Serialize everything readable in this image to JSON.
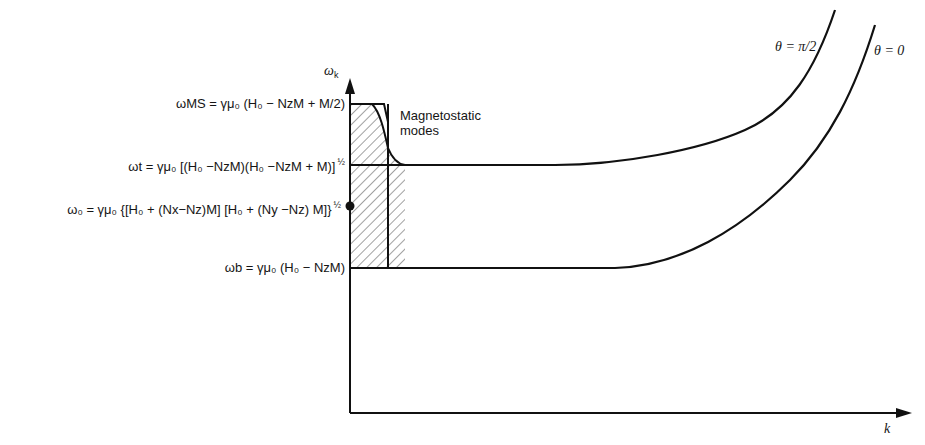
{
  "diagram": {
    "type": "dispersion-diagram",
    "axes": {
      "y_label": "ωk",
      "x_label": "k"
    },
    "levels": {
      "omega_ms": {
        "symbol": "ωMS",
        "expr": "= γμ₀ (H₀ − NzM + M/2)"
      },
      "omega_t": {
        "symbol": "ωt",
        "expr": "= γμ₀ [(H₀ −NzM)(H₀ −NzM + M)]",
        "exponent": "½"
      },
      "omega_0": {
        "symbol": "ω₀",
        "expr": "= γμ₀ {[H₀ + (Nx−Nz)M] [H₀ + (Ny −Nz) M]}",
        "exponent": "½"
      },
      "omega_b": {
        "symbol": "ωb",
        "expr": "= γμ₀ (H₀ − NzM)"
      }
    },
    "annotations": {
      "magnetostatic": [
        "Magnetostatic",
        "modes"
      ],
      "theta_pi2": "θ = π/2",
      "theta_0": "θ = 0"
    },
    "colors": {
      "line": "#111111",
      "hatch": "#444444",
      "background": "#ffffff"
    }
  }
}
